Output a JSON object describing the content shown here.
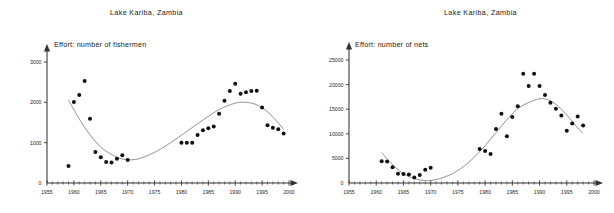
{
  "figure": {
    "background_color": "#ffffff",
    "point_color": "#111111",
    "curve_color": "#6f6f6f",
    "axis_color": "#333333"
  },
  "panels": [
    {
      "id": "fishermen",
      "title": "Lake Kariba, Zambia",
      "axis_note": "Effort: number of fishermen",
      "chart_data": {
        "type": "scatter",
        "title": "Lake Kariba, Zambia",
        "subtitle": "Effort: number of fishermen",
        "xlabel": "",
        "ylabel": "Effort: number of fishermen",
        "xlim": [
          1955,
          2000
        ],
        "ylim": [
          0,
          3000
        ],
        "xticks": [
          1955,
          1960,
          1965,
          1970,
          1975,
          1980,
          1985,
          1990,
          1995,
          2000
        ],
        "yticks": [
          0,
          1000,
          2000,
          3000
        ],
        "minor_x_tick_interval": 1,
        "grid": false,
        "legend": false,
        "series": [
          {
            "name": "Number of fishermen",
            "marker": "filled-circle",
            "x": [
              1959,
              1960,
              1961,
              1962,
              1963,
              1964,
              1965,
              1966,
              1967,
              1968,
              1969,
              1970,
              1980,
              1981,
              1982,
              1983,
              1984,
              1985,
              1986,
              1987,
              1988,
              1989,
              1990,
              1991,
              1992,
              1993,
              1994,
              1995,
              1996,
              1997,
              1998,
              1999
            ],
            "y": [
              420,
              2010,
              2180,
              2530,
              1590,
              770,
              640,
              520,
              510,
              600,
              690,
              570,
              1000,
              1000,
              1000,
              1190,
              1310,
              1360,
              1400,
              1720,
              2040,
              2280,
              2460,
              2210,
              2250,
              2280,
              2290,
              1870,
              1430,
              1370,
              1330,
              1230
            ]
          }
        ],
        "fit_curve": {
          "name": "polynomial trend",
          "x": [
            1959,
            1962,
            1965,
            1968,
            1970,
            1972,
            1975,
            1978,
            1981,
            1984,
            1987,
            1990,
            1992,
            1994,
            1996,
            1998,
            1999
          ],
          "y": [
            2050,
            1380,
            890,
            640,
            580,
            600,
            760,
            1000,
            1280,
            1560,
            1820,
            1980,
            2000,
            1940,
            1770,
            1490,
            1330
          ]
        }
      }
    },
    {
      "id": "nets",
      "title": "Lake Kariba, Zambia",
      "axis_note": "Effort: number of nets",
      "chart_data": {
        "type": "scatter",
        "title": "Lake Kariba, Zambia",
        "subtitle": "Effort: number of nets",
        "xlabel": "",
        "ylabel": "Effort: number of nets",
        "xlim": [
          1955,
          2000
        ],
        "ylim": [
          0,
          25000
        ],
        "xticks": [
          1955,
          1960,
          1965,
          1970,
          1975,
          1980,
          1985,
          1990,
          1995,
          2000
        ],
        "yticks": [
          0,
          5000,
          10000,
          15000,
          20000,
          25000
        ],
        "minor_x_tick_interval": 1,
        "grid": false,
        "legend": false,
        "series": [
          {
            "name": "Number of nets",
            "marker": "filled-circle",
            "x": [
              1961,
              1962,
              1963,
              1964,
              1965,
              1966,
              1967,
              1968,
              1969,
              1970,
              1979,
              1980,
              1981,
              1982,
              1983,
              1984,
              1985,
              1986,
              1987,
              1988,
              1989,
              1990,
              1991,
              1992,
              1993,
              1994,
              1995,
              1996,
              1997,
              1998
            ],
            "y": [
              4400,
              4350,
              3200,
              1900,
              1850,
              1750,
              1100,
              1650,
              2700,
              3100,
              6900,
              6500,
              5900,
              11000,
              14100,
              9500,
              13400,
              15600,
              22200,
              19700,
              22200,
              19700,
              17900,
              16300,
              15100,
              13700,
              10600,
              12100,
              13500,
              11700
            ]
          }
        ],
        "fit_curve": {
          "name": "polynomial trend",
          "x": [
            1961,
            1963,
            1965,
            1967,
            1969,
            1971,
            1974,
            1977,
            1980,
            1983,
            1986,
            1989,
            1991,
            1993,
            1995,
            1997,
            1998
          ],
          "y": [
            6200,
            3700,
            1900,
            900,
            500,
            700,
            1900,
            4200,
            7600,
            11600,
            15100,
            16800,
            17100,
            16000,
            13800,
            11200,
            10100
          ]
        }
      }
    }
  ]
}
